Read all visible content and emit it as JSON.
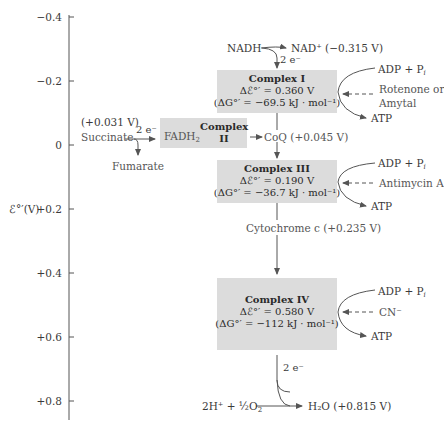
{
  "axis": {
    "label": "ℰ°′(V)",
    "ticks": [
      "−0.4",
      "−0.2",
      "0",
      "+0.2",
      "+0.4",
      "+0.6",
      "+0.8"
    ]
  },
  "nadh": {
    "donor": "NADH",
    "electrons": "2 e⁻",
    "product": "NAD⁺ (−0.315 V)"
  },
  "complex1": {
    "title": "Complex I",
    "delta_e": "Δℰ°′ = 0.360 V",
    "delta_g": "(ΔG°′ = −69.5 kJ · mol⁻¹)",
    "adp": "ADP + P",
    "adp_sub": "i",
    "inhibitor_line1": "Rotenone or",
    "inhibitor_line2": "Amytal",
    "atp": "ATP"
  },
  "complex2": {
    "title_line1": "Complex",
    "title_line2": "II",
    "fadh": "FADH",
    "fadh_sub": "2",
    "succinate_potential": "(+0.031 V)",
    "succinate": "Succinate",
    "electrons": "2 e⁻",
    "fumarate": "Fumarate"
  },
  "coq": {
    "label": "CoQ (+0.045 V)"
  },
  "complex3": {
    "title": "Complex III",
    "delta_e": "Δℰ°′ = 0.190 V",
    "delta_g": "(ΔG°′ = −36.7 kJ · mol⁻¹)",
    "adp": "ADP + P",
    "adp_sub": "i",
    "inhibitor": "Antimycin A",
    "atp": "ATP"
  },
  "cytc": {
    "label": "Cytochrome c (+0.235 V)"
  },
  "complex4": {
    "title": "Complex IV",
    "delta_e": "Δℰ°′ = 0.580 V",
    "delta_g": "(ΔG°′ = −112 kJ · mol⁻¹)",
    "adp": "ADP + P",
    "adp_sub": "i",
    "inhibitor": "CN⁻",
    "atp": "ATP"
  },
  "oxygen": {
    "electrons": "2 e⁻",
    "reactant": "2H⁺ + ½O",
    "reactant_sub": "2",
    "product": "H₂O (+0.815 V)"
  },
  "colors": {
    "box_fill": "#dcdcdc",
    "line": "#555555",
    "text": "#3a3a3a"
  }
}
